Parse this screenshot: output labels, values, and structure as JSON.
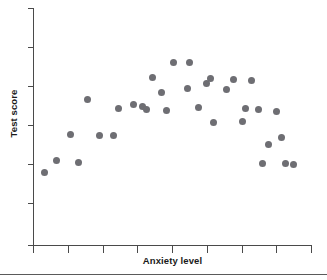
{
  "chart_data": {
    "type": "scatter",
    "title": "",
    "xlabel": "Anxiety level",
    "ylabel": "Test score",
    "grid": false,
    "legend": null,
    "xlim": [
      0,
      10
    ],
    "ylim": [
      0,
      10
    ],
    "x_tick_labels": [
      "",
      "",
      "",
      "",
      "",
      "",
      "",
      "",
      ""
    ],
    "y_tick_labels": [
      "",
      "",
      "",
      "",
      "",
      ""
    ],
    "marker": {
      "shape": "circle",
      "color": "#6e6e73",
      "size_px": 7
    },
    "points": [
      {
        "x": 0.42,
        "y": 3.05
      },
      {
        "x": 0.83,
        "y": 3.55
      },
      {
        "x": 1.33,
        "y": 4.65
      },
      {
        "x": 1.63,
        "y": 3.5
      },
      {
        "x": 1.95,
        "y": 6.12
      },
      {
        "x": 2.38,
        "y": 4.62
      },
      {
        "x": 2.9,
        "y": 4.6
      },
      {
        "x": 3.08,
        "y": 5.78
      },
      {
        "x": 3.62,
        "y": 5.92
      },
      {
        "x": 3.92,
        "y": 5.85
      },
      {
        "x": 4.08,
        "y": 5.72
      },
      {
        "x": 4.28,
        "y": 7.05
      },
      {
        "x": 4.6,
        "y": 6.42
      },
      {
        "x": 4.78,
        "y": 5.68
      },
      {
        "x": 5.05,
        "y": 7.72
      },
      {
        "x": 5.52,
        "y": 6.62
      },
      {
        "x": 5.62,
        "y": 7.72
      },
      {
        "x": 5.92,
        "y": 5.8
      },
      {
        "x": 6.22,
        "y": 6.82
      },
      {
        "x": 6.35,
        "y": 7.02
      },
      {
        "x": 6.48,
        "y": 5.18
      },
      {
        "x": 6.92,
        "y": 6.58
      },
      {
        "x": 7.18,
        "y": 7.0
      },
      {
        "x": 7.52,
        "y": 5.22
      },
      {
        "x": 7.62,
        "y": 5.78
      },
      {
        "x": 7.82,
        "y": 6.92
      },
      {
        "x": 8.08,
        "y": 5.7
      },
      {
        "x": 8.22,
        "y": 3.45
      },
      {
        "x": 8.45,
        "y": 4.22
      },
      {
        "x": 8.72,
        "y": 5.62
      },
      {
        "x": 8.92,
        "y": 4.52
      },
      {
        "x": 9.05,
        "y": 3.42
      },
      {
        "x": 9.35,
        "y": 3.4
      }
    ]
  },
  "axes": {
    "y_label": "Test score",
    "x_label": "Anxiety level"
  }
}
